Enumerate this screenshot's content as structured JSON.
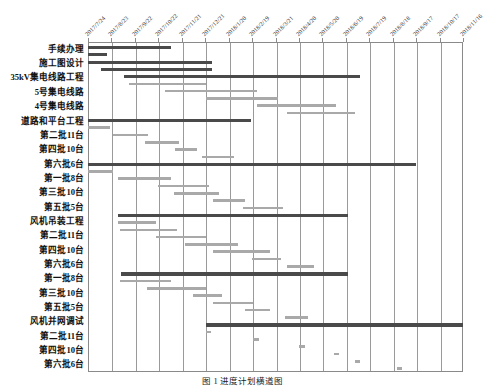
{
  "caption": "图 1  进度计划横道图",
  "colors": {
    "bar_dark": "#4a4a4a",
    "bar_light": "#a9a9a9",
    "grid": "#9a9a9a",
    "frame": "#8a8a8a",
    "text": "#111111",
    "background": "#ffffff"
  },
  "chart_data": {
    "type": "bar",
    "title": "图 1  进度计划横道图",
    "orientation": "horizontal",
    "subtype": "gantt",
    "xlabel": "",
    "ylabel": "",
    "grid": true,
    "legend": "none",
    "x_axis": {
      "type": "date",
      "start": "2017/7/24",
      "end": "2018/11/16",
      "tick_interval_days": 30,
      "ticks": [
        "2017/7/24",
        "2017/8/23",
        "2017/9/22",
        "2017/10/22",
        "2017/11/21",
        "2017/12/21",
        "2018/1/20",
        "2018/2/19",
        "2018/3/21",
        "2018/4/20",
        "2018/5/20",
        "2018/6/19",
        "2018/7/19",
        "2018/8/18",
        "2018/9/17",
        "2018/10/17",
        "2018/11/16"
      ]
    },
    "categories": [
      "手续办理",
      "施工图设计",
      "35kV集电线路工程",
      "5号集电线路",
      "4号集电线路",
      "道路和平台工程",
      "第二批11台",
      "第四批10台",
      "第六批6台",
      "第一批8台",
      "第三批10台",
      "第五批5台",
      "风机吊装工程",
      "第二批11台",
      "第四批10台",
      "第六批6台",
      "第一批8台",
      "第三批10台",
      "第五批5台",
      "风机并网调试",
      "第二批11台",
      "第四批10台",
      "第六批6台"
    ],
    "tasks": [
      {
        "label": "手续办理",
        "style": "dark",
        "start_tick": 0.0,
        "end_tick": 3.55,
        "row": 0.0
      },
      {
        "label": "(手续办理 子项)",
        "style": "dark",
        "start_tick": 0.0,
        "end_tick": 0.8,
        "row": 0.5
      },
      {
        "label": "施工图设计",
        "style": "dark",
        "start_tick": 0.0,
        "end_tick": 5.3,
        "row": 1.0
      },
      {
        "label": "(施工图设计 子项)",
        "style": "dark",
        "start_tick": 0.55,
        "end_tick": 5.3,
        "row": 1.5
      },
      {
        "label": "35kV集电线路工程",
        "style": "dark",
        "start_tick": 1.55,
        "end_tick": 11.6,
        "row": 2.0
      },
      {
        "label": "(集电线路 子项)",
        "style": "light",
        "start_tick": 1.75,
        "end_tick": 5.05,
        "row": 2.5
      },
      {
        "label": "5号集电线路",
        "style": "light",
        "start_tick": 3.3,
        "end_tick": 7.2,
        "row": 3.0
      },
      {
        "label": "(5号 子项)",
        "style": "light",
        "start_tick": 5.05,
        "end_tick": 8.1,
        "row": 3.5
      },
      {
        "label": "4号集电线路",
        "style": "light",
        "start_tick": 7.2,
        "end_tick": 10.6,
        "row": 4.0
      },
      {
        "label": "(4号 子项)",
        "style": "light",
        "start_tick": 8.5,
        "end_tick": 11.4,
        "row": 4.5
      },
      {
        "label": "道路和平台工程",
        "style": "dark",
        "start_tick": 0.0,
        "end_tick": 6.95,
        "row": 5.0
      },
      {
        "label": "(道路 子项)",
        "style": "light",
        "start_tick": 0.0,
        "end_tick": 0.95,
        "row": 5.5
      },
      {
        "label": "第二批11台",
        "style": "light",
        "start_tick": 1.05,
        "end_tick": 2.55,
        "row": 6.0
      },
      {
        "label": "(第二批 子项)",
        "style": "light",
        "start_tick": 2.45,
        "end_tick": 3.9,
        "row": 6.5
      },
      {
        "label": "第四批10台",
        "style": "light",
        "start_tick": 3.7,
        "end_tick": 4.65,
        "row": 7.0
      },
      {
        "label": "(第四批 子项)",
        "style": "light",
        "start_tick": 4.85,
        "end_tick": 6.25,
        "row": 7.5
      },
      {
        "label": "第六批6台",
        "style": "dark",
        "start_tick": 0.0,
        "end_tick": 14.0,
        "row": 8.0
      },
      {
        "label": "(第六批 子项)",
        "style": "light",
        "start_tick": 0.0,
        "end_tick": 1.05,
        "row": 8.5
      },
      {
        "label": "第一批8台",
        "style": "light",
        "start_tick": 1.3,
        "end_tick": 3.55,
        "row": 9.0
      },
      {
        "label": "(第一批 子项)",
        "style": "light",
        "start_tick": 3.0,
        "end_tick": 5.15,
        "row": 9.5
      },
      {
        "label": "第三批10台",
        "style": "light",
        "start_tick": 3.65,
        "end_tick": 5.6,
        "row": 10.0
      },
      {
        "label": "(第三批 子项)",
        "style": "light",
        "start_tick": 5.35,
        "end_tick": 6.7,
        "row": 10.5
      },
      {
        "label": "第五批5台",
        "style": "light",
        "start_tick": 6.6,
        "end_tick": 8.3,
        "row": 11.0
      },
      {
        "label": "(第五批 子项)",
        "style": "dark",
        "start_tick": 1.3,
        "end_tick": 11.1,
        "row": 11.5
      },
      {
        "label": "风机吊装工程",
        "style": "light",
        "start_tick": 1.3,
        "end_tick": 2.9,
        "row": 12.0
      },
      {
        "label": "(吊装 子项)",
        "style": "light",
        "start_tick": 1.35,
        "end_tick": 3.8,
        "row": 12.5
      },
      {
        "label": "第二批11台",
        "style": "light",
        "start_tick": 2.9,
        "end_tick": 5.05,
        "row": 13.0
      },
      {
        "label": "(第二批b 子项)",
        "style": "light",
        "start_tick": 4.15,
        "end_tick": 6.4,
        "row": 13.5
      },
      {
        "label": "第四批10台",
        "style": "light",
        "start_tick": 5.35,
        "end_tick": 7.75,
        "row": 14.0
      },
      {
        "label": "(第四批b 子项)",
        "style": "light",
        "start_tick": 7.0,
        "end_tick": 8.25,
        "row": 14.5
      },
      {
        "label": "第六批6台",
        "style": "light",
        "start_tick": 8.5,
        "end_tick": 9.65,
        "row": 15.0
      },
      {
        "label": "(第六批b 子项)",
        "style": "dark",
        "start_tick": 1.4,
        "end_tick": 11.1,
        "row": 15.5
      },
      {
        "label": "第一批8台",
        "style": "light",
        "start_tick": 1.35,
        "end_tick": 3.55,
        "row": 16.0
      },
      {
        "label": "(第一批b 子项)",
        "style": "light",
        "start_tick": 2.5,
        "end_tick": 5.05,
        "row": 16.5
      },
      {
        "label": "第三批10台",
        "style": "light",
        "start_tick": 4.5,
        "end_tick": 5.7,
        "row": 17.0
      },
      {
        "label": "(第三批b 子项)",
        "style": "light",
        "start_tick": 5.35,
        "end_tick": 7.05,
        "row": 17.5
      },
      {
        "label": "第五批5台",
        "style": "light",
        "start_tick": 6.7,
        "end_tick": 7.75,
        "row": 18.0
      },
      {
        "label": "(第五批b 子项)",
        "style": "light",
        "start_tick": 8.4,
        "end_tick": 9.4,
        "row": 18.5
      },
      {
        "label": "风机并网调试",
        "style": "dark",
        "start_tick": 5.05,
        "end_tick": 16.0,
        "row": 19.0
      },
      {
        "label": "(并网 子项)",
        "style": "light",
        "start_tick": 5.05,
        "end_tick": 5.25,
        "row": 19.5
      },
      {
        "label": "第二批11台",
        "style": "light",
        "start_tick": 7.05,
        "end_tick": 7.3,
        "row": 20.0
      },
      {
        "label": "(第二批c 子项)",
        "style": "light",
        "start_tick": 9.0,
        "end_tick": 9.25,
        "row": 20.5
      },
      {
        "label": "第四批10台",
        "style": "light",
        "start_tick": 10.5,
        "end_tick": 10.7,
        "row": 21.0
      },
      {
        "label": "(第四批c 子项)",
        "style": "light",
        "start_tick": 11.4,
        "end_tick": 11.6,
        "row": 21.5
      },
      {
        "label": "第六批6台",
        "style": "light",
        "start_tick": 13.2,
        "end_tick": 13.4,
        "row": 22.0
      }
    ]
  }
}
